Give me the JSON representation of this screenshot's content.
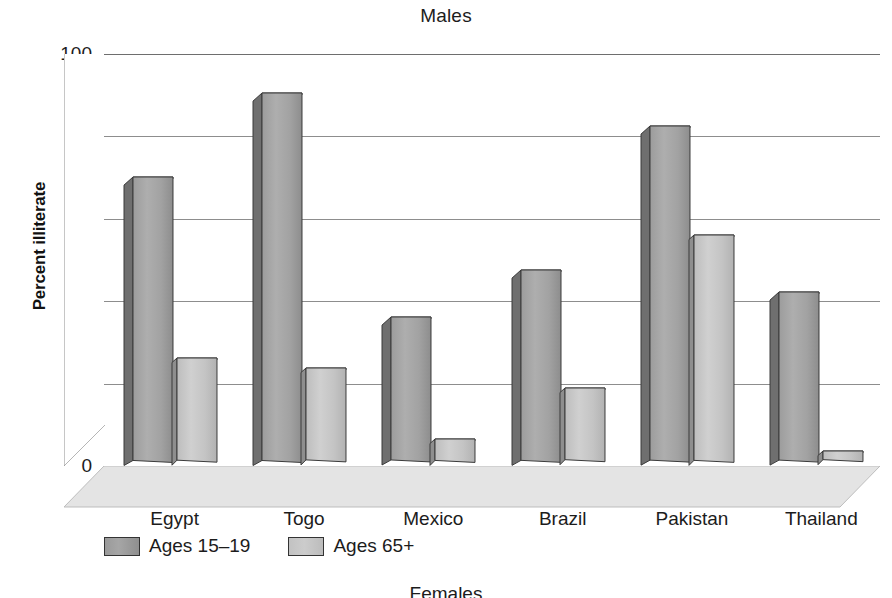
{
  "chart_data": {
    "type": "bar",
    "title": "Males",
    "xlabel": "",
    "ylabel": "Percent illiterate",
    "ylim": [
      0,
      100
    ],
    "yticks": [
      0,
      20,
      40,
      60,
      80,
      100
    ],
    "grid": true,
    "legend_position": "bottom-left",
    "style": "3d-perspective-column",
    "categories": [
      "Egypt",
      "Togo",
      "Mexico",
      "Brazil",
      "Pakistan",
      "Thailand"
    ],
    "series": [
      {
        "name": "Ages 15–19",
        "color": "#a4a4a4",
        "values": [
          68.8,
          89.2,
          34.7,
          46.2,
          81.1,
          40.8
        ]
      },
      {
        "name": "Ages 65+",
        "color": "#c6c6c6",
        "values": [
          24.8,
          22.3,
          5.2,
          17.4,
          54.7,
          2.1
        ]
      }
    ]
  },
  "axis": {
    "y_tick_labels": [
      "100",
      "80",
      "60",
      "40",
      "20",
      "0"
    ],
    "y_title": "Percent illiterate"
  },
  "legend": {
    "items": [
      {
        "label": "Ages 15–19",
        "swatch": "series-a"
      },
      {
        "label": "Ages 65+",
        "swatch": "series-b"
      }
    ]
  },
  "next_chart": {
    "title": "Females"
  },
  "colors": {
    "series_a_front": "#a4a4a4",
    "series_a_side": "#6f6f6f",
    "series_a_top": "#8a8a8a",
    "series_b_front": "#c6c6c6",
    "series_b_side": "#8e8e8e",
    "series_b_top": "#b0b0b0",
    "floor": "#e2e2e2",
    "gridline": "#8d8d8d",
    "text": "#1c1c1c"
  }
}
